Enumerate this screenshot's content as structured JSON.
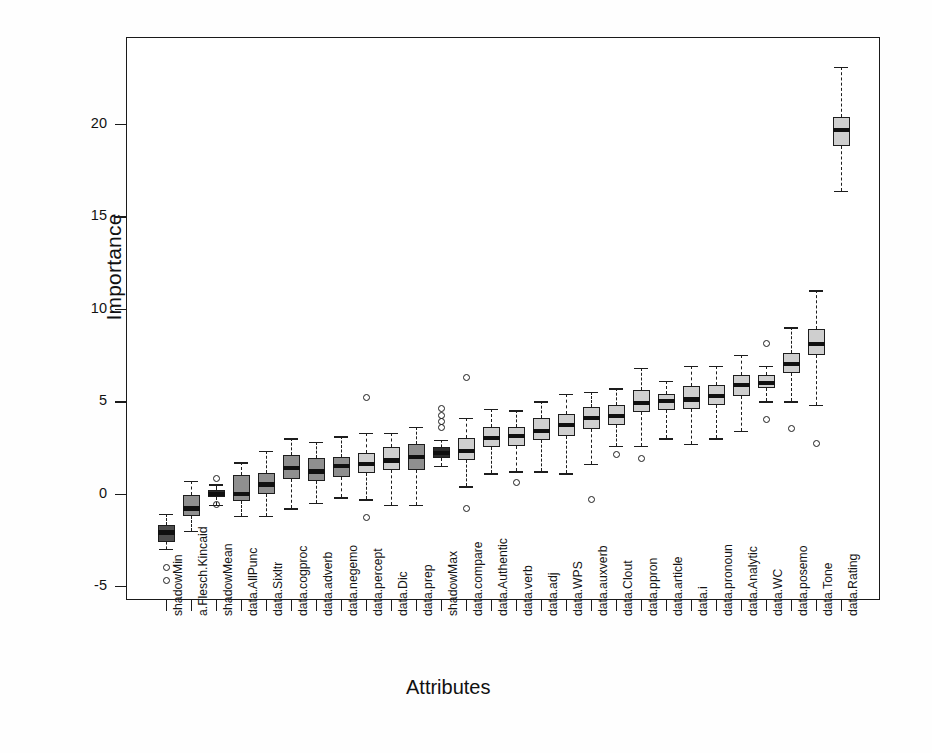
{
  "chart_data": {
    "type": "boxplot",
    "title": "",
    "xlabel": "Attributes",
    "ylabel": "Importance",
    "ylim": [
      -6.2,
      24.2
    ],
    "yticks": [
      20,
      15,
      10,
      5,
      0,
      -5
    ],
    "grid": false,
    "legend": "none",
    "colors": {
      "shadow_dark": "#4d4d4d",
      "shadow_darkest": "#2b2b2b",
      "data_mid": "#8f8f8f",
      "data_light": "#cfcfcf",
      "line": "#1d1d1d",
      "background": "#ffffff"
    },
    "categories": [
      "shadowMin",
      "a.Flesch.Kincaid",
      "shadowMean",
      "data.AllPunc",
      "data.Sixltr",
      "data.cogproc",
      "data.adverb",
      "data.negemo",
      "data.percept",
      "data.Dic",
      "data.prep",
      "shadowMax",
      "data.compare",
      "data.Authentic",
      "data.verb",
      "data.adj",
      "data.WPS",
      "data.auxverb",
      "data.Clout",
      "data.ppron",
      "data.article",
      "data.i",
      "data.pronoun",
      "data.Analytic",
      "data.WC",
      "data.posemo",
      "data.Tone",
      "data.Rating"
    ],
    "boxes": [
      {
        "name": "shadowMin",
        "shade": "dark",
        "whisk_lo": -3.0,
        "q1": -2.6,
        "median": -2.1,
        "q3": -1.7,
        "whisk_hi": -1.1,
        "outliers": [
          -4.0,
          -4.7
        ]
      },
      {
        "name": "a.Flesch.Kincaid",
        "shade": "mid",
        "whisk_lo": -2.0,
        "q1": -1.2,
        "median": -0.8,
        "q3": -0.1,
        "whisk_hi": 0.7,
        "outliers": []
      },
      {
        "name": "shadowMean",
        "shade": "darkest",
        "whisk_lo": -0.6,
        "q1": -0.2,
        "median": 0.0,
        "q3": 0.2,
        "whisk_hi": 0.5,
        "outliers": [
          0.8,
          -0.6
        ]
      },
      {
        "name": "data.AllPunc",
        "shade": "mid",
        "whisk_lo": -1.2,
        "q1": -0.4,
        "median": 0.0,
        "q3": 1.0,
        "whisk_hi": 1.7,
        "outliers": []
      },
      {
        "name": "data.Sixltr",
        "shade": "mid",
        "whisk_lo": -1.2,
        "q1": 0.0,
        "median": 0.5,
        "q3": 1.1,
        "whisk_hi": 2.3,
        "outliers": []
      },
      {
        "name": "data.cogproc",
        "shade": "mid",
        "whisk_lo": -0.8,
        "q1": 0.8,
        "median": 1.4,
        "q3": 2.1,
        "whisk_hi": 3.0,
        "outliers": []
      },
      {
        "name": "data.adverb",
        "shade": "mid",
        "whisk_lo": -0.5,
        "q1": 0.7,
        "median": 1.2,
        "q3": 1.9,
        "whisk_hi": 2.8,
        "outliers": []
      },
      {
        "name": "data.negemo",
        "shade": "mid",
        "whisk_lo": -0.2,
        "q1": 0.9,
        "median": 1.5,
        "q3": 2.0,
        "whisk_hi": 3.1,
        "outliers": []
      },
      {
        "name": "data.percept",
        "shade": "light",
        "whisk_lo": -0.3,
        "q1": 1.1,
        "median": 1.6,
        "q3": 2.2,
        "whisk_hi": 3.3,
        "outliers": [
          5.2,
          -1.3
        ]
      },
      {
        "name": "data.Dic",
        "shade": "light",
        "whisk_lo": -0.6,
        "q1": 1.3,
        "median": 1.8,
        "q3": 2.5,
        "whisk_hi": 3.3,
        "outliers": []
      },
      {
        "name": "data.prep",
        "shade": "mid",
        "whisk_lo": -0.6,
        "q1": 1.3,
        "median": 2.0,
        "q3": 2.7,
        "whisk_hi": 3.6,
        "outliers": []
      },
      {
        "name": "shadowMax",
        "shade": "darkest",
        "whisk_lo": 1.5,
        "q1": 1.9,
        "median": 2.2,
        "q3": 2.5,
        "whisk_hi": 2.9,
        "outliers": [
          4.6,
          4.2,
          3.9,
          3.6
        ]
      },
      {
        "name": "data.compare",
        "shade": "light",
        "whisk_lo": 0.4,
        "q1": 1.8,
        "median": 2.3,
        "q3": 3.0,
        "whisk_hi": 4.1,
        "outliers": [
          6.3,
          -0.8
        ]
      },
      {
        "name": "data.Authentic",
        "shade": "light",
        "whisk_lo": 1.1,
        "q1": 2.5,
        "median": 3.0,
        "q3": 3.6,
        "whisk_hi": 4.6,
        "outliers": []
      },
      {
        "name": "data.verb",
        "shade": "light",
        "whisk_lo": 1.2,
        "q1": 2.6,
        "median": 3.1,
        "q3": 3.6,
        "whisk_hi": 4.5,
        "outliers": [
          0.6
        ]
      },
      {
        "name": "data.adj",
        "shade": "light",
        "whisk_lo": 1.2,
        "q1": 2.9,
        "median": 3.4,
        "q3": 4.1,
        "whisk_hi": 5.0,
        "outliers": []
      },
      {
        "name": "data.WPS",
        "shade": "light",
        "whisk_lo": 1.1,
        "q1": 3.1,
        "median": 3.7,
        "q3": 4.3,
        "whisk_hi": 5.4,
        "outliers": []
      },
      {
        "name": "data.auxverb",
        "shade": "light",
        "whisk_lo": 1.6,
        "q1": 3.5,
        "median": 4.1,
        "q3": 4.7,
        "whisk_hi": 5.5,
        "outliers": [
          -0.3
        ]
      },
      {
        "name": "data.Clout",
        "shade": "light",
        "whisk_lo": 2.6,
        "q1": 3.7,
        "median": 4.2,
        "q3": 4.8,
        "whisk_hi": 5.7,
        "outliers": [
          2.1
        ]
      },
      {
        "name": "data.ppron",
        "shade": "light",
        "whisk_lo": 2.6,
        "q1": 4.4,
        "median": 4.9,
        "q3": 5.6,
        "whisk_hi": 6.8,
        "outliers": [
          1.9
        ]
      },
      {
        "name": "data.article",
        "shade": "light",
        "whisk_lo": 3.0,
        "q1": 4.5,
        "median": 5.0,
        "q3": 5.4,
        "whisk_hi": 6.1,
        "outliers": []
      },
      {
        "name": "data.i",
        "shade": "light",
        "whisk_lo": 2.7,
        "q1": 4.6,
        "median": 5.1,
        "q3": 5.8,
        "whisk_hi": 6.9,
        "outliers": []
      },
      {
        "name": "data.pronoun",
        "shade": "light",
        "whisk_lo": 3.0,
        "q1": 4.8,
        "median": 5.3,
        "q3": 5.9,
        "whisk_hi": 6.9,
        "outliers": []
      },
      {
        "name": "data.Analytic",
        "shade": "light",
        "whisk_lo": 3.4,
        "q1": 5.3,
        "median": 5.9,
        "q3": 6.4,
        "whisk_hi": 7.5,
        "outliers": []
      },
      {
        "name": "data.WC",
        "shade": "light",
        "whisk_lo": 5.0,
        "q1": 5.7,
        "median": 6.0,
        "q3": 6.4,
        "whisk_hi": 6.9,
        "outliers": [
          8.1,
          4.0
        ]
      },
      {
        "name": "data.posemo",
        "shade": "light",
        "whisk_lo": 5.0,
        "q1": 6.5,
        "median": 7.0,
        "q3": 7.6,
        "whisk_hi": 9.0,
        "outliers": [
          3.5
        ]
      },
      {
        "name": "data.Tone",
        "shade": "light",
        "whisk_lo": 4.8,
        "q1": 7.5,
        "median": 8.1,
        "q3": 8.9,
        "whisk_hi": 11.0,
        "outliers": [
          2.7
        ]
      },
      {
        "name": "data.Rating",
        "shade": "light",
        "whisk_lo": 16.4,
        "q1": 18.8,
        "median": 19.7,
        "q3": 20.4,
        "whisk_hi": 23.1,
        "outliers": []
      }
    ]
  }
}
